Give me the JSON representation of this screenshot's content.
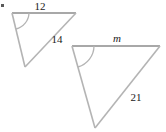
{
  "figure": {
    "type": "similar-triangles-diagram",
    "stroke_color": "#b4b4b4",
    "label_color": "#1a1a1a",
    "background_color": "#ffffff",
    "corner_artifact": {
      "name": "corner-tick",
      "visible": true
    },
    "triangles": [
      {
        "id": "small-triangle",
        "name": "left-triangle",
        "vertices": {
          "top_left": [
            12,
            13
          ],
          "top_right": [
            76,
            13
          ],
          "bottom": [
            25,
            67
          ]
        },
        "angle_mark": {
          "at": "top_left",
          "arc_radius": 17,
          "label": ""
        },
        "labels": {
          "top_side": "12",
          "right_side": "14",
          "left_side": ""
        },
        "label_positions": {
          "top_side": [
            40,
            6
          ],
          "right_side": [
            57,
            39
          ]
        },
        "label_styles": {
          "top_side": "upright",
          "right_side": "upright"
        }
      },
      {
        "id": "large-triangle",
        "name": "right-triangle",
        "vertices": {
          "top_left": [
            72,
            46
          ],
          "top_right": [
            160,
            46
          ],
          "bottom": [
            95,
            128
          ]
        },
        "angle_mark": {
          "at": "top_left",
          "arc_radius": 22,
          "label": ""
        },
        "labels": {
          "top_side": "m",
          "right_side": "21",
          "left_side": ""
        },
        "label_positions": {
          "top_side": [
            117,
            38
          ],
          "right_side": [
            136,
            97
          ]
        },
        "label_styles": {
          "top_side": "italic",
          "right_side": "upright"
        }
      }
    ]
  }
}
